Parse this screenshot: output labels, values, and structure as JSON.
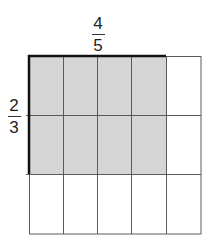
{
  "diagram": {
    "top_label": {
      "numerator": "4",
      "denominator": "5"
    },
    "side_label": {
      "numerator": "2",
      "denominator": "3"
    },
    "grid": {
      "columns": 5,
      "rows": 3,
      "shaded_columns": 4,
      "shaded_rows": 2
    },
    "colors": {
      "shade": "#d5d5d5",
      "line": "#5a5a5a",
      "bold": "#111111"
    }
  }
}
